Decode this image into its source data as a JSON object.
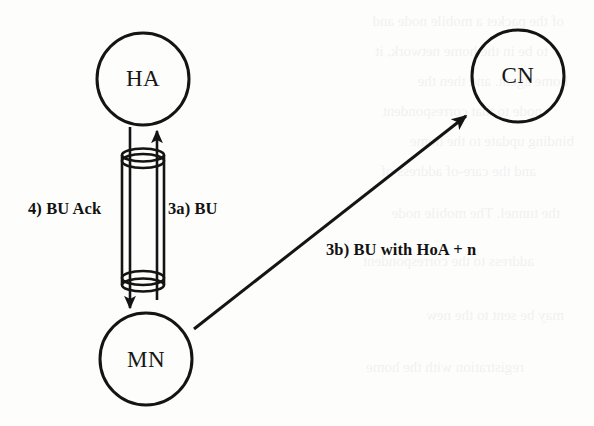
{
  "diagram": {
    "type": "network-protocol-flow-diagram",
    "canvas": {
      "width": 594,
      "height": 426,
      "background": "#fdfdfc"
    },
    "stroke_color": "#141414",
    "text_color": "#171717",
    "nodes": [
      {
        "id": "ha",
        "label": "HA",
        "cx": 143,
        "cy": 79,
        "r": 46
      },
      {
        "id": "mn",
        "label": "MN",
        "cx": 146,
        "cy": 359,
        "r": 46
      },
      {
        "id": "cn",
        "label": "CN",
        "cx": 518,
        "cy": 76,
        "r": 46
      }
    ],
    "tunnel": {
      "name": "bidirectional-tunnel",
      "left_x": 122,
      "right_x": 164,
      "top_y": 161,
      "bottom_y": 278,
      "ellipse_ry": 7
    },
    "edges": [
      {
        "id": "bu-up",
        "label": "3a) BU",
        "from": "mn",
        "to": "ha",
        "direction": "up",
        "inside_tunnel": true
      },
      {
        "id": "bu-ack-down",
        "label": "4) BU Ack",
        "from": "ha",
        "to": "mn",
        "direction": "down",
        "inside_tunnel": true
      },
      {
        "id": "bu-hoa",
        "label": "3b) BU with HoA + n",
        "from": "mn",
        "to": "cn",
        "direction": "diagonal-up-right",
        "inside_tunnel": false
      }
    ],
    "labels": {
      "bu_ack": "4) BU Ack",
      "bu": "3a) BU",
      "bu_with_hoa": "3b) BU with HoA + n"
    }
  },
  "ghost_text": {
    "note": "faint show-through of text printed on the reverse side of the scanned page",
    "lines": [
      "of the packet a mobile node and",
      "to be in the home network, it",
      "home agent. and then the",
      "node to that correspondent",
      "binding update to the home",
      "and the care-of address of",
      "the tunnel. The mobile node",
      "address to the correspondent",
      "may be sent to the new",
      "registration with the home"
    ]
  }
}
